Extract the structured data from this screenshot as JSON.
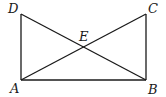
{
  "diagram": {
    "type": "geometry",
    "points": {
      "A": {
        "x": 21,
        "y": 80,
        "label": "A",
        "label_x": 10,
        "label_y": 93
      },
      "B": {
        "x": 146,
        "y": 80,
        "label": "B",
        "label_x": 148,
        "label_y": 94
      },
      "C": {
        "x": 146,
        "y": 14,
        "label": "C",
        "label_x": 148,
        "label_y": 13
      },
      "D": {
        "x": 21,
        "y": 14,
        "label": "D",
        "label_x": 8,
        "label_y": 13
      },
      "E": {
        "x": 83.5,
        "y": 47,
        "label": "E",
        "label_x": 79,
        "label_y": 41
      }
    },
    "segments": [
      {
        "name": "AB",
        "from": "A",
        "to": "B"
      },
      {
        "name": "BC",
        "from": "B",
        "to": "C"
      },
      {
        "name": "AD",
        "from": "A",
        "to": "D"
      },
      {
        "name": "AC",
        "from": "A",
        "to": "C"
      },
      {
        "name": "DB",
        "from": "D",
        "to": "B"
      }
    ],
    "stroke_color": "#1a1a1a"
  }
}
